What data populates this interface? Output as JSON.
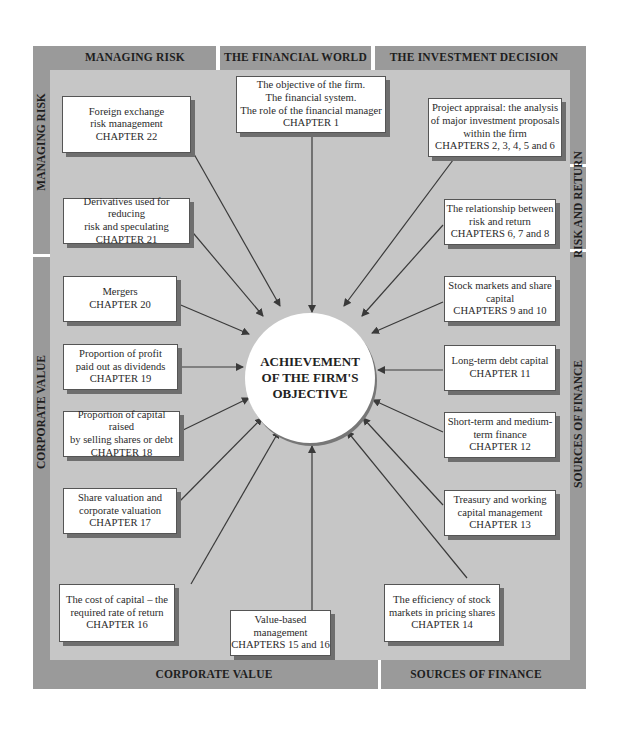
{
  "diagram": {
    "center": {
      "lines": [
        "ACHIEVEMENT",
        "OF THE FIRM'S",
        "OBJECTIVE"
      ]
    },
    "frame_labels": {
      "top": [
        "MANAGING RISK",
        "THE FINANCIAL WORLD",
        "THE INVESTMENT DECISION"
      ],
      "bottom": [
        "CORPORATE VALUE",
        "SOURCES OF FINANCE"
      ],
      "left": [
        "MANAGING RISK",
        "CORPORATE VALUE"
      ],
      "right": [
        "RISK AND RETURN",
        "SOURCES OF FINANCE"
      ]
    },
    "boxes": [
      {
        "id": "financial-world",
        "lines": [
          "The objective of the firm.",
          "The financial system.",
          "The role of the financial manager",
          "CHAPTER 1"
        ]
      },
      {
        "id": "project-appraisal",
        "lines": [
          "Project appraisal: the analysis",
          "of major investment proposals",
          "within the firm",
          "CHAPTERS 2, 3, 4, 5 and 6"
        ]
      },
      {
        "id": "risk-return",
        "lines": [
          "The relationship between",
          "risk and return",
          "CHAPTERS 6, 7 and 8"
        ]
      },
      {
        "id": "stock-markets",
        "lines": [
          "Stock markets and share",
          "capital",
          "CHAPTERS 9 and 10"
        ]
      },
      {
        "id": "long-term-debt",
        "lines": [
          "Long-term debt capital",
          "CHAPTER 11"
        ]
      },
      {
        "id": "short-term-finance",
        "lines": [
          "Short-term and medium-",
          "term finance",
          "CHAPTER 12"
        ]
      },
      {
        "id": "treasury",
        "lines": [
          "Treasury and working",
          "capital management",
          "CHAPTER 13"
        ]
      },
      {
        "id": "market-efficiency",
        "lines": [
          "The efficiency of stock",
          "markets in pricing shares",
          "CHAPTER 14"
        ]
      },
      {
        "id": "value-based-management",
        "lines": [
          "Value-based management",
          "CHAPTERS 15 and 16"
        ]
      },
      {
        "id": "cost-of-capital",
        "lines": [
          "The cost of capital – the",
          "required rate of return",
          "CHAPTER 16"
        ]
      },
      {
        "id": "share-valuation",
        "lines": [
          "Share valuation and",
          "corporate valuation",
          "CHAPTER 17"
        ]
      },
      {
        "id": "capital-structure",
        "lines": [
          "Proportion of capital raised",
          "by selling shares or debt",
          "CHAPTER 18"
        ]
      },
      {
        "id": "dividends",
        "lines": [
          "Proportion of profit",
          "paid out as dividends",
          "CHAPTER 19"
        ]
      },
      {
        "id": "mergers",
        "lines": [
          "Mergers",
          "CHAPTER 20"
        ]
      },
      {
        "id": "derivatives",
        "lines": [
          "Derivatives used for reducing",
          "risk and speculating",
          "CHAPTER 21"
        ]
      },
      {
        "id": "forex",
        "lines": [
          "Foreign exchange",
          "risk management",
          "CHAPTER 22"
        ]
      }
    ],
    "colors": {
      "frame": "#9a9a9a",
      "inner": "#c6c6c6",
      "box": "#ffffff",
      "shadow": "#6e6e6e",
      "arrow": "#3a3a3a"
    }
  }
}
